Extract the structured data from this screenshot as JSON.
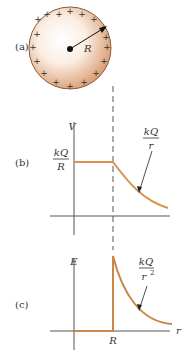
{
  "colors": {
    "curve": "#d9914e",
    "axis": "#555555",
    "sphere_edge": "#b8805a",
    "sphere_fill": "#e0a57a",
    "text": "#333333"
  },
  "panel_a": {
    "label": "(a)",
    "radius_label": "R",
    "charge_symbol": "+"
  },
  "panel_b": {
    "label": "(b)",
    "y_axis_label": "V",
    "inside_value": {
      "num": "kQ",
      "den": "R"
    },
    "outside_annotation": {
      "num": "kQ",
      "den": "r"
    }
  },
  "panel_c": {
    "label": "(c)",
    "y_axis_label": "E",
    "x_axis_label": "r",
    "x_tick_label": "R",
    "outside_annotation": {
      "num": "kQ",
      "den": "r",
      "den_exp": "2"
    }
  }
}
